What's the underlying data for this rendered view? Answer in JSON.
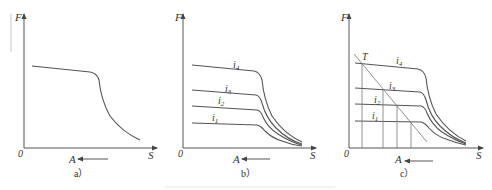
{
  "figure": {
    "panels": [
      {
        "id": "a",
        "caption": "a）",
        "y_axis_label": "F",
        "x_axis_label": "S",
        "origin_label": "0",
        "direction_label": "A",
        "curves": []
      },
      {
        "id": "b",
        "caption": "b）",
        "y_axis_label": "F",
        "x_axis_label": "S",
        "origin_label": "0",
        "direction_label": "A",
        "curves": [
          "i4",
          "i3",
          "i2",
          "i1"
        ],
        "curve_labels": {
          "i4": "i",
          "i4_sub": "4",
          "i3": "i",
          "i3_sub": "3",
          "i2": "i",
          "i2_sub": "2",
          "i1": "i",
          "i1_sub": "1"
        }
      },
      {
        "id": "c",
        "caption": "c）",
        "y_axis_label": "F",
        "x_axis_label": "S",
        "origin_label": "0",
        "direction_label": "A",
        "point_label": "T",
        "curve_labels": {
          "i4": "i",
          "i4_sub": "4",
          "i3": "i",
          "i3_sub": "3",
          "i2": "i",
          "i2_sub": "2",
          "i1": "i",
          "i1_sub": "1"
        }
      }
    ]
  }
}
